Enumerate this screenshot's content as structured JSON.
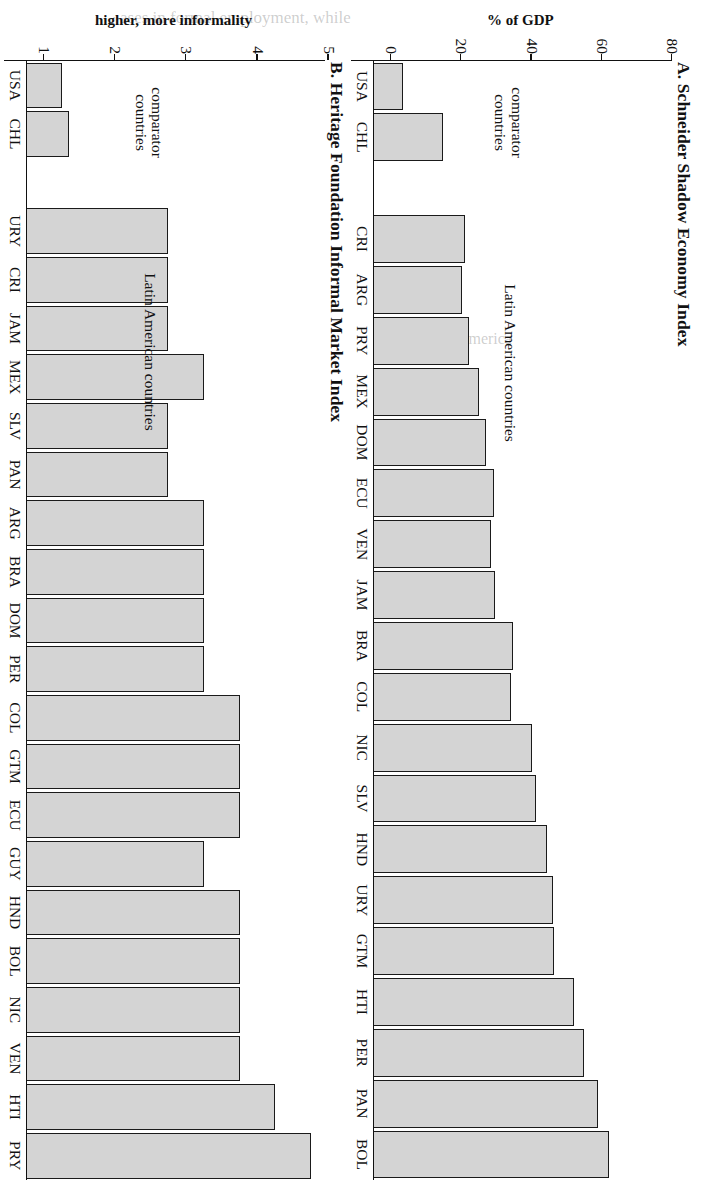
{
  "figure": {
    "orientation": "rotated-90",
    "bar_fill_color": "#d4d4d4",
    "bar_edge_color": "#1a1a1a"
  },
  "panelA": {
    "title": "A. Schneider Shadow Economy Index",
    "axis_title": "% of GDP",
    "ticks": [
      "0",
      "20",
      "40",
      "60",
      "80"
    ],
    "group_label_comparator": "comparator\ncountries",
    "group_label_latin": "Latin American countries"
  },
  "panelB": {
    "title": "B. Heritage Foundation Informal Market Index",
    "axis_title": "higher, more informality",
    "ticks": [
      "1",
      "2",
      "3",
      "4",
      "5"
    ],
    "group_label_comparator": "comparator\ncountries",
    "group_label_latin": "Latin American countries"
  },
  "ghost_text": {
    "line1": "ases in formal employment, while",
    "line2": "Latin America",
    "line3": "1.5 percent."
  },
  "chart_data": [
    {
      "type": "bar",
      "panel": "A",
      "title": "A. Schneider Shadow Economy Index",
      "xlabel": "",
      "ylabel": "% of GDP",
      "ylim": [
        0,
        85
      ],
      "yticks": [
        0,
        20,
        40,
        60,
        80
      ],
      "grid": false,
      "legend": null,
      "annotations": [
        "comparator countries",
        "Latin American countries"
      ],
      "categories": [
        "USA",
        "CHL",
        "",
        "CRI",
        "ARG",
        "PRY",
        "MEX",
        "DOM",
        "ECU",
        "VEN",
        "JAM",
        "BRA",
        "COL",
        "NIC",
        "SLV",
        "HND",
        "URY",
        "GTM",
        "HTI",
        "PER",
        "PAN",
        "BOL"
      ],
      "values": [
        8.6,
        19.8,
        null,
        26.2,
        25.4,
        27.4,
        30.1,
        32.1,
        34.4,
        33.6,
        34.7,
        39.8,
        39.1,
        45.2,
        46.3,
        49.6,
        51.1,
        51.5,
        57.1,
        59.9,
        64.1,
        67.1
      ],
      "groups": {
        "comparator": [
          "USA",
          "CHL"
        ],
        "latin_american": [
          "CRI",
          "ARG",
          "PRY",
          "MEX",
          "DOM",
          "ECU",
          "VEN",
          "JAM",
          "BRA",
          "COL",
          "NIC",
          "SLV",
          "HND",
          "URY",
          "GTM",
          "HTI",
          "PER",
          "PAN",
          "BOL"
        ]
      }
    },
    {
      "type": "bar",
      "panel": "B",
      "title": "B. Heritage Foundation Informal Market Index",
      "xlabel": "",
      "ylabel": "higher, more informality",
      "ylim": [
        1,
        5.2
      ],
      "yticks": [
        1,
        2,
        3,
        4,
        5
      ],
      "grid": false,
      "legend": null,
      "annotations": [
        "comparator countries",
        "Latin American countries"
      ],
      "categories": [
        "USA",
        "CHL",
        "",
        "URY",
        "CRI",
        "JAM",
        "MEX",
        "SLV",
        "PAN",
        "ARG",
        "BRA",
        "DOM",
        "PER",
        "COL",
        "GTM",
        "ECU",
        "GUY",
        "HND",
        "BOL",
        "NIC",
        "VEN",
        "HTI",
        "PRY"
      ],
      "values": [
        1.5,
        1.6,
        null,
        3.0,
        3.0,
        3.0,
        3.5,
        3.0,
        3.0,
        3.5,
        3.5,
        3.5,
        3.5,
        4.0,
        4.0,
        4.0,
        3.5,
        4.0,
        4.0,
        4.0,
        4.0,
        4.5,
        5.0
      ],
      "groups": {
        "comparator": [
          "USA",
          "CHL"
        ],
        "latin_american": [
          "URY",
          "CRI",
          "JAM",
          "MEX",
          "SLV",
          "PAN",
          "ARG",
          "BRA",
          "DOM",
          "PER",
          "COL",
          "GTM",
          "ECU",
          "GUY",
          "HND",
          "BOL",
          "NIC",
          "VEN",
          "HTI",
          "PRY"
        ]
      }
    }
  ]
}
